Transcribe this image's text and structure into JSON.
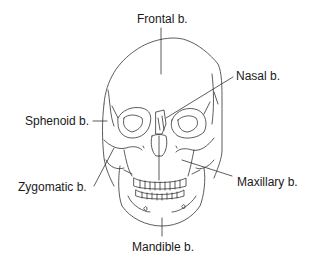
{
  "diagram": {
    "labels": {
      "frontal": "Frontal b.",
      "nasal": "Nasal b.",
      "sphenoid": "Sphenoid b.",
      "zygomatic": "Zygomatic b.",
      "maxillary": "Maxillary b.",
      "mandible": "Mandible b."
    },
    "colors": {
      "line": "#333333",
      "text": "#1a1a1a",
      "background": "#ffffff"
    }
  }
}
